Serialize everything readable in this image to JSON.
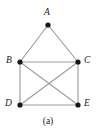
{
  "figure": {
    "caption": "(a)",
    "background_color": "#ffffff",
    "edge_color": "#9d9d9d",
    "vertex_color": "#161616",
    "label_color": "#1a1a1a",
    "vertices": [
      {
        "id": "A",
        "label": "A",
        "x": 48,
        "y": 25,
        "label_x": 44,
        "label_y": 8,
        "label_anchor": "above"
      },
      {
        "id": "B",
        "label": "B",
        "x": 20,
        "y": 62,
        "label_x": 6,
        "label_y": 56,
        "label_anchor": "left"
      },
      {
        "id": "C",
        "label": "C",
        "x": 78,
        "y": 62,
        "label_x": 84,
        "label_y": 56,
        "label_anchor": "right"
      },
      {
        "id": "D",
        "label": "D",
        "x": 20,
        "y": 105,
        "label_x": 5,
        "label_y": 99,
        "label_anchor": "left"
      },
      {
        "id": "E",
        "label": "E",
        "x": 78,
        "y": 105,
        "label_x": 84,
        "label_y": 99,
        "label_anchor": "right"
      }
    ],
    "edges": [
      {
        "id": "A-B",
        "from": "A",
        "to": "B"
      },
      {
        "id": "A-C",
        "from": "A",
        "to": "C"
      },
      {
        "id": "B-C",
        "from": "B",
        "to": "C"
      },
      {
        "id": "B-D",
        "from": "B",
        "to": "D"
      },
      {
        "id": "B-E",
        "from": "B",
        "to": "E"
      },
      {
        "id": "C-D",
        "from": "C",
        "to": "D"
      },
      {
        "id": "C-E",
        "from": "C",
        "to": "E"
      },
      {
        "id": "D-E",
        "from": "D",
        "to": "E"
      }
    ],
    "vertex_radius": 2.6
  }
}
